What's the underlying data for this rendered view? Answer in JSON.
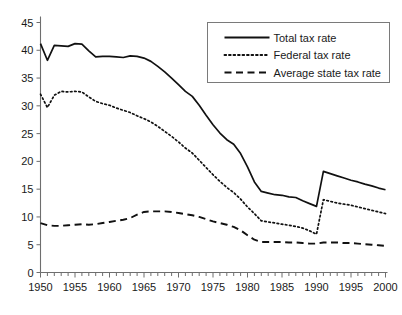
{
  "chart_data": {
    "type": "line",
    "title": "",
    "subtitle": "",
    "xlabel": "",
    "ylabel": "",
    "xlim": [
      1950,
      2000
    ],
    "ylim": [
      0,
      45
    ],
    "ytick_step": 5,
    "xtick_step": 5,
    "xtick_minor_step": 1,
    "grid": false,
    "legend_position": "top-right",
    "yticks": [
      "0",
      "5",
      "10",
      "15",
      "20",
      "25",
      "30",
      "35",
      "40",
      "45"
    ],
    "xticks": [
      "1950",
      "1955",
      "1960",
      "1965",
      "1970",
      "1975",
      "1980",
      "1985",
      "1990",
      "1995",
      "2000"
    ],
    "x": [
      1950,
      1951,
      1952,
      1953,
      1954,
      1955,
      1956,
      1957,
      1958,
      1959,
      1960,
      1961,
      1962,
      1963,
      1964,
      1965,
      1966,
      1967,
      1968,
      1969,
      1970,
      1971,
      1972,
      1973,
      1974,
      1975,
      1976,
      1977,
      1978,
      1979,
      1980,
      1981,
      1982,
      1983,
      1984,
      1985,
      1986,
      1987,
      1988,
      1989,
      1990,
      1991,
      1992,
      1993,
      1994,
      1995,
      1996,
      1997,
      1998,
      1999,
      2000
    ],
    "series": [
      {
        "name": "Total tax rate",
        "style": "solid",
        "color": "#111111",
        "values": [
          41.2,
          38.2,
          40.9,
          40.8,
          40.7,
          41.2,
          41.1,
          39.9,
          38.8,
          38.9,
          38.9,
          38.8,
          38.7,
          39.0,
          38.9,
          38.6,
          38.0,
          37.1,
          36.1,
          35.0,
          33.8,
          32.6,
          31.7,
          30.1,
          28.3,
          26.6,
          25.1,
          23.9,
          23.1,
          21.4,
          19.0,
          16.3,
          14.6,
          14.3,
          14.0,
          13.9,
          13.6,
          13.5,
          12.9,
          12.4,
          11.9,
          18.2,
          17.8,
          17.4,
          17.0,
          16.6,
          16.3,
          15.9,
          15.6,
          15.2,
          14.9
        ]
      },
      {
        "name": "Federal tax rate",
        "style": "dotted",
        "color": "#111111",
        "values": [
          32.1,
          29.7,
          31.9,
          32.6,
          32.5,
          32.6,
          32.5,
          31.6,
          30.8,
          30.4,
          30.1,
          29.6,
          29.2,
          28.8,
          28.2,
          27.7,
          27.1,
          26.3,
          25.4,
          24.5,
          23.5,
          22.4,
          21.5,
          20.2,
          18.9,
          17.6,
          16.4,
          15.3,
          14.4,
          13.2,
          11.8,
          10.6,
          9.3,
          9.1,
          8.9,
          8.7,
          8.5,
          8.3,
          8.0,
          7.5,
          6.9,
          13.1,
          12.8,
          12.5,
          12.3,
          12.1,
          11.8,
          11.5,
          11.2,
          10.9,
          10.6
        ]
      },
      {
        "name": "Average state tax rate",
        "style": "dashed",
        "color": "#111111",
        "values": [
          8.9,
          8.5,
          8.4,
          8.4,
          8.5,
          8.6,
          8.7,
          8.6,
          8.7,
          8.9,
          9.1,
          9.3,
          9.5,
          9.8,
          10.4,
          10.9,
          11.0,
          11.0,
          11.0,
          10.9,
          10.7,
          10.5,
          10.3,
          10.0,
          9.6,
          9.2,
          8.9,
          8.6,
          8.2,
          7.6,
          6.7,
          5.9,
          5.5,
          5.5,
          5.5,
          5.5,
          5.4,
          5.4,
          5.3,
          5.2,
          5.2,
          5.4,
          5.4,
          5.4,
          5.3,
          5.3,
          5.2,
          5.1,
          5.0,
          4.9,
          4.8
        ]
      }
    ],
    "legend": [
      {
        "label": "Total tax rate",
        "style": "solid"
      },
      {
        "label": "Federal tax rate",
        "style": "dotted"
      },
      {
        "label": "Average state tax rate",
        "style": "dashed"
      }
    ]
  }
}
